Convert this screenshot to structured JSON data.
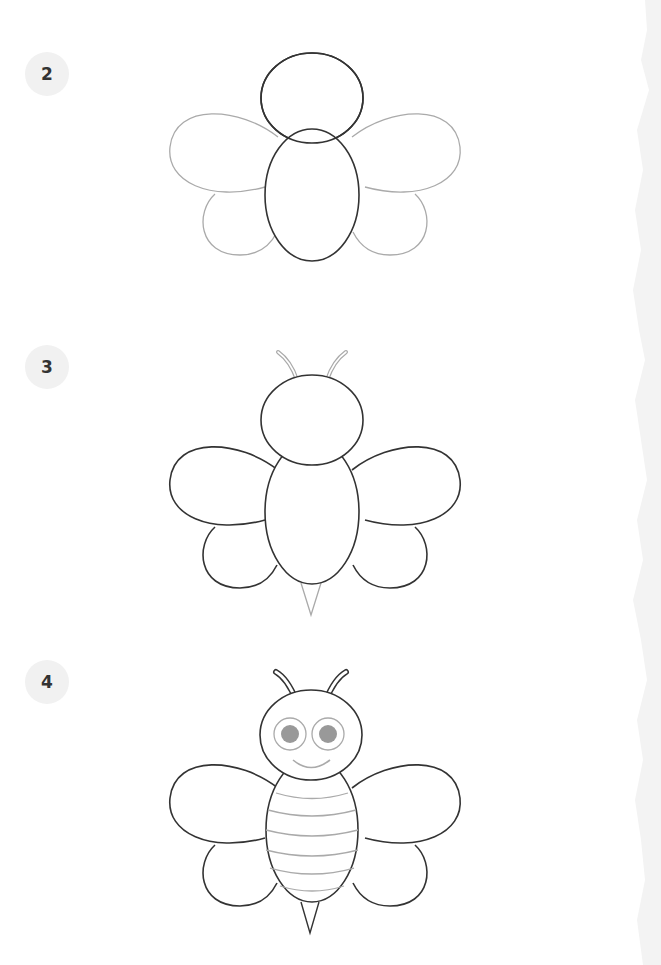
{
  "steps": [
    {
      "number": "2",
      "label": "Step 2: Add four wings"
    },
    {
      "number": "3",
      "label": "Step 3: Add antennae and stinger"
    },
    {
      "number": "4",
      "label": "Step 4: Add eyes, smile and stripes"
    }
  ],
  "colors": {
    "ink": "#333333",
    "new_lines": "#aaaaaa",
    "eye_fill": "#999999",
    "badge_bg": "#f1f1f1"
  }
}
